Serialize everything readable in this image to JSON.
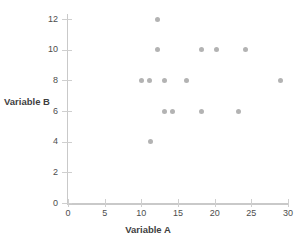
{
  "chart_data": {
    "type": "scatter",
    "title": "",
    "xlabel": "Variable A",
    "ylabel": "Variable B",
    "xlim": [
      0,
      30
    ],
    "ylim": [
      0,
      12.6
    ],
    "xticks": [
      0,
      5,
      10,
      15,
      20,
      25,
      30
    ],
    "yticks": [
      0,
      2,
      4,
      6,
      8,
      10,
      12
    ],
    "xtick_labels": [
      "0",
      "5",
      "10",
      "15",
      "20",
      "25",
      "30"
    ],
    "ytick_labels": [
      "0",
      "2",
      "4",
      "6",
      "8",
      "10",
      "12"
    ],
    "grid": false,
    "legend": null,
    "marker_color": "#b3b3b3",
    "axis_color": "#c9c9c9",
    "points": [
      {
        "x": 12.2,
        "y": 12
      },
      {
        "x": 12.2,
        "y": 10
      },
      {
        "x": 18.2,
        "y": 10
      },
      {
        "x": 20.2,
        "y": 10
      },
      {
        "x": 24.2,
        "y": 10
      },
      {
        "x": 10.0,
        "y": 8
      },
      {
        "x": 11.1,
        "y": 8
      },
      {
        "x": 13.2,
        "y": 8
      },
      {
        "x": 16.2,
        "y": 8
      },
      {
        "x": 29.0,
        "y": 8
      },
      {
        "x": 13.2,
        "y": 6
      },
      {
        "x": 14.2,
        "y": 6
      },
      {
        "x": 18.2,
        "y": 6
      },
      {
        "x": 23.2,
        "y": 6
      },
      {
        "x": 11.2,
        "y": 4
      }
    ]
  },
  "axis": {
    "x_title": "Variable A",
    "y_title": "Variable B"
  }
}
